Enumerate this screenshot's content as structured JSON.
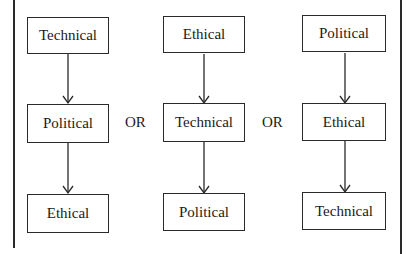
{
  "diagram": {
    "type": "flowchart-alternatives",
    "separator_label": "OR",
    "columns": [
      {
        "steps": [
          "Technical",
          "Political",
          "Ethical"
        ]
      },
      {
        "steps": [
          "Ethical",
          "Technical",
          "Political"
        ]
      },
      {
        "steps": [
          "Political",
          "Ethical",
          "Technical"
        ]
      }
    ],
    "colors": {
      "line": "#2a2a2a",
      "text": "#1a1a1a",
      "background": "#ffffff"
    }
  }
}
